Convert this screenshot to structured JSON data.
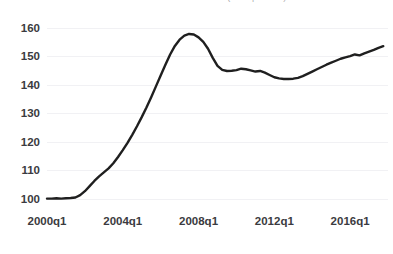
{
  "chart_title": "Case-Shiller Home Price Index (2000q1 = 100)",
  "axes": {
    "y_ticks": [
      100,
      110,
      120,
      130,
      140,
      150,
      160
    ],
    "y_min": 96,
    "y_max": 162,
    "x_ticks": [
      "2000q1",
      "2004q1",
      "2008q1",
      "2012q1",
      "2016q1"
    ],
    "x_tick_values": [
      2000.0,
      2004.0,
      2008.0,
      2012.0,
      2016.0
    ],
    "x_min": 2000.0,
    "x_max": 2018.0
  },
  "style": {
    "line_color": "#1f1f1f",
    "line_width": 2.4,
    "grid_color": "#f1f1f4",
    "background": "#ffffff",
    "label_color": "#3b3b40"
  },
  "chart_data": {
    "type": "line",
    "title": "Case-Shiller Home Price Index (2000q1 = 100)",
    "subtitle": "",
    "xlabel": "",
    "ylabel": "",
    "xlim": [
      2000.0,
      2018.0
    ],
    "ylim": [
      96,
      162
    ],
    "grid": true,
    "legend": "none",
    "y_ticks": [
      100,
      110,
      120,
      130,
      140,
      150,
      160
    ],
    "x_tick_labels": [
      "2000q1",
      "2004q1",
      "2008q1",
      "2012q1",
      "2016q1"
    ],
    "x_tick_positions": [
      2000.0,
      2004.0,
      2008.0,
      2012.0,
      2016.0
    ],
    "series": [
      {
        "name": "Home Price Index",
        "color": "#1f1f1f",
        "x": [
          2000.0,
          2000.25,
          2000.5,
          2000.75,
          2001.0,
          2001.25,
          2001.5,
          2001.75,
          2002.0,
          2002.25,
          2002.5,
          2002.75,
          2003.0,
          2003.25,
          2003.5,
          2003.75,
          2004.0,
          2004.25,
          2004.5,
          2004.75,
          2005.0,
          2005.25,
          2005.5,
          2005.75,
          2006.0,
          2006.25,
          2006.5,
          2006.75,
          2007.0,
          2007.25,
          2007.5,
          2007.75,
          2008.0,
          2008.25,
          2008.5,
          2008.75,
          2009.0,
          2009.25,
          2009.5,
          2009.75,
          2010.0,
          2010.25,
          2010.5,
          2010.75,
          2011.0,
          2011.25,
          2011.5,
          2011.75,
          2012.0,
          2012.25,
          2012.5,
          2012.75,
          2013.0,
          2013.25,
          2013.5,
          2013.75,
          2014.0,
          2014.25,
          2014.5,
          2014.75,
          2015.0,
          2015.25,
          2015.5,
          2015.75,
          2016.0,
          2016.25,
          2016.5,
          2016.75,
          2017.0,
          2017.25,
          2017.5,
          2017.75
        ],
        "y": [
          100.0,
          100.0,
          100.1,
          100.0,
          100.1,
          100.2,
          100.4,
          101.2,
          102.6,
          104.4,
          106.2,
          107.8,
          109.2,
          110.6,
          112.4,
          114.6,
          117.0,
          119.6,
          122.4,
          125.4,
          128.6,
          132.0,
          135.6,
          139.4,
          143.2,
          147.0,
          150.6,
          153.6,
          155.8,
          157.2,
          157.8,
          157.6,
          156.6,
          155.0,
          152.6,
          149.4,
          146.6,
          145.2,
          144.8,
          144.9,
          145.1,
          145.6,
          145.4,
          145.0,
          144.6,
          144.8,
          144.2,
          143.4,
          142.6,
          142.2,
          142.0,
          142.0,
          142.1,
          142.4,
          143.0,
          143.8,
          144.6,
          145.4,
          146.2,
          147.0,
          147.7,
          148.4,
          149.1,
          149.6,
          150.0,
          150.6,
          150.3,
          151.0,
          151.6,
          152.2,
          152.9,
          153.5
        ]
      }
    ]
  }
}
